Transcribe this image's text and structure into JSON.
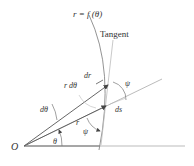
{
  "diagram": {
    "curve_label": "r = f (θ)",
    "tangent_label": "Tangent",
    "labels": {
      "dr": "dr",
      "r_dtheta": "r dθ",
      "psi_upper": "ψ",
      "dtheta": "dθ",
      "ds": "ds",
      "r": "r",
      "psi_lower": "ψ",
      "theta": "θ",
      "origin": "O"
    },
    "colors": {
      "curve": "#888888",
      "lines": "#555555",
      "tangent": "#bbbbbb",
      "text": "#333333"
    }
  }
}
